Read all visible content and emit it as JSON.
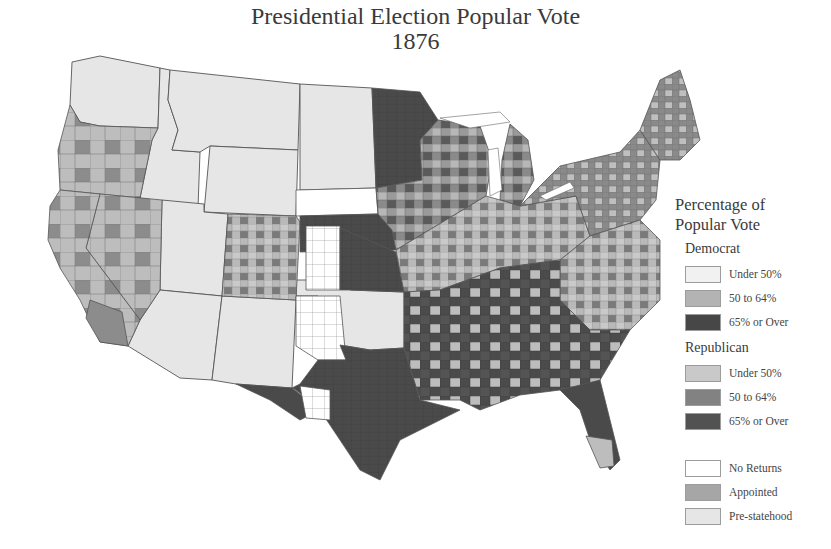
{
  "title": {
    "line1": "Presidential Election Popular Vote",
    "line2": "1876"
  },
  "legend": {
    "heading_line1": "Percentage of",
    "heading_line2": "Popular Vote",
    "groups": [
      {
        "name": "Democrat",
        "items": [
          {
            "label": "Under 50%",
            "color": "#f1f1f1"
          },
          {
            "label": "50 to 64%",
            "color": "#b3b3b3"
          },
          {
            "label": "65% or Over",
            "color": "#474747"
          }
        ]
      },
      {
        "name": "Republican",
        "items": [
          {
            "label": "Under 50%",
            "color": "#c9c9c9"
          },
          {
            "label": "50 to 64%",
            "color": "#828282"
          },
          {
            "label": "65% or Over",
            "color": "#525252"
          }
        ]
      }
    ],
    "other": [
      {
        "label": "No Returns",
        "color": "#ffffff"
      },
      {
        "label": "Appointed",
        "color": "#a6a6a6"
      },
      {
        "label": "Pre-statehood",
        "color": "#e6e6e6"
      }
    ]
  },
  "map": {
    "region": "Contiguous United States",
    "shading": "county-level popular vote share",
    "colors": {
      "pre_statehood": "#e6e6e6",
      "no_returns": "#ffffff",
      "dem_high": "#474747",
      "dem_mid": "#b3b3b3",
      "rep_low": "#c9c9c9",
      "rep_mid": "#828282",
      "border": "#555555"
    }
  }
}
